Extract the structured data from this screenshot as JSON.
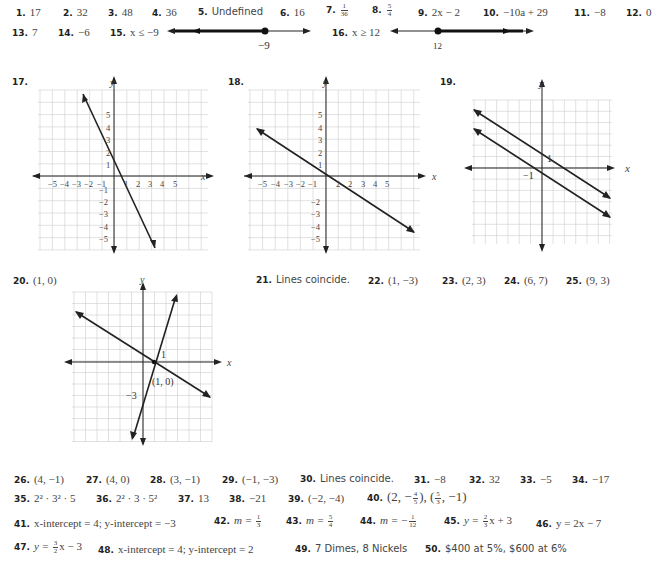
{
  "row1": [
    {
      "num": "1.",
      "val": "17"
    },
    {
      "num": "2.",
      "val": "32"
    },
    {
      "num": "3.",
      "val": "48"
    },
    {
      "num": "4.",
      "val": "36"
    },
    {
      "num": "5.",
      "val": "Undefined"
    },
    {
      "num": "6.",
      "val": "16"
    },
    {
      "num": "7.",
      "val_num": "1",
      "val_den": "36"
    },
    {
      "num": "8.",
      "val_num": "5",
      "val_den": "4"
    },
    {
      "num": "9.",
      "val": "2x − 2"
    },
    {
      "num": "10.",
      "val": "−10a + 29"
    },
    {
      "num": "11.",
      "val": "−8"
    },
    {
      "num": "12.",
      "val": "0"
    }
  ],
  "row2": [
    {
      "num": "13.",
      "val": "7"
    },
    {
      "num": "14.",
      "val": "−6"
    },
    {
      "num": "15.",
      "val": "x ≤ −9",
      "numberline_label": "−9"
    },
    {
      "num": "16.",
      "val": "x ≥ 12",
      "numberline_label": "12"
    }
  ],
  "graphs": {
    "g17": {
      "num": "17.",
      "xlabel": "x",
      "ylabel": "y",
      "xticks": [
        "−5",
        "−4",
        "−3",
        "−2",
        "−1",
        "1",
        "2",
        "3",
        "4",
        "5"
      ],
      "yticks": [
        "5",
        "4",
        "3",
        "2",
        "1",
        "−1",
        "−2",
        "−3",
        "−4",
        "−5"
      ]
    },
    "g18": {
      "num": "18.",
      "xlabel": "x",
      "ylabel": "y",
      "xticks": [
        "−5",
        "−4",
        "−3",
        "−2",
        "−1",
        "1",
        "2",
        "3",
        "4",
        "5"
      ],
      "yticks": [
        "5",
        "4",
        "3",
        "2",
        "1",
        "−1",
        "−2",
        "−3",
        "−4",
        "−5"
      ]
    },
    "g19": {
      "num": "19.",
      "xlabel": "x",
      "ylabel": "y",
      "label_a": "1",
      "label_b": "−1"
    },
    "g20": {
      "num": "20.",
      "answer": "(1, 0)",
      "xlabel": "x",
      "ylabel": "y",
      "label_1": "1",
      "label_pt": "(1, 0)",
      "label_m3": "−3"
    }
  },
  "row21": [
    {
      "num": "21.",
      "val": "Lines coincide."
    },
    {
      "num": "22.",
      "val": "(1, −3)"
    },
    {
      "num": "23.",
      "val": "(2, 3)"
    },
    {
      "num": "24.",
      "val": "(6, 7)"
    },
    {
      "num": "25.",
      "val": "(9, 3)"
    }
  ],
  "row26": [
    {
      "num": "26.",
      "val": "(4, −1)"
    },
    {
      "num": "27.",
      "val": "(4, 0)"
    },
    {
      "num": "28.",
      "val": "(3, −1)"
    },
    {
      "num": "29.",
      "val": "(−1, −3)"
    },
    {
      "num": "30.",
      "val": "Lines coincide."
    },
    {
      "num": "31.",
      "val": "−8"
    },
    {
      "num": "32.",
      "val": "32"
    },
    {
      "num": "33.",
      "val": "−5"
    },
    {
      "num": "34.",
      "val": "−17"
    }
  ],
  "row35": [
    {
      "num": "35.",
      "val": "2² · 3² · 5"
    },
    {
      "num": "36.",
      "val": "2² · 3 · 5²"
    },
    {
      "num": "37.",
      "val": "13"
    },
    {
      "num": "38.",
      "val": "−21"
    },
    {
      "num": "39.",
      "val": "(−2, −4)"
    },
    {
      "num": "40.",
      "val_a": "(2, −",
      "frac_a_num": "4",
      "frac_a_den": "5",
      "val_b": "), (",
      "frac_b_num": "5",
      "frac_b_den": "3",
      "val_c": ", −1)"
    }
  ],
  "row41": [
    {
      "num": "41.",
      "val": "x-intercept = 4; y-intercept = −3"
    },
    {
      "num": "42.",
      "pre": "m = ",
      "frac_num": "1",
      "frac_den": "3"
    },
    {
      "num": "43.",
      "pre": "m = ",
      "frac_num": "5",
      "frac_den": "4"
    },
    {
      "num": "44.",
      "pre": "m = −",
      "frac_num": "1",
      "frac_den": "12"
    },
    {
      "num": "45.",
      "pre": "y = ",
      "frac_num": "2",
      "frac_den": "3",
      "post": "x + 3"
    },
    {
      "num": "46.",
      "val": "y = 2x − 7"
    }
  ],
  "row47": [
    {
      "num": "47.",
      "pre": "y = ",
      "frac_num": "3",
      "frac_den": "2",
      "post": "x − 3"
    },
    {
      "num": "48.",
      "val": "x-intercept = 4; y-intercept = 2"
    },
    {
      "num": "49.",
      "val": "7 Dimes, 8 Nickels"
    },
    {
      "num": "50.",
      "val": "$400 at 5%, $600 at 6%"
    }
  ]
}
